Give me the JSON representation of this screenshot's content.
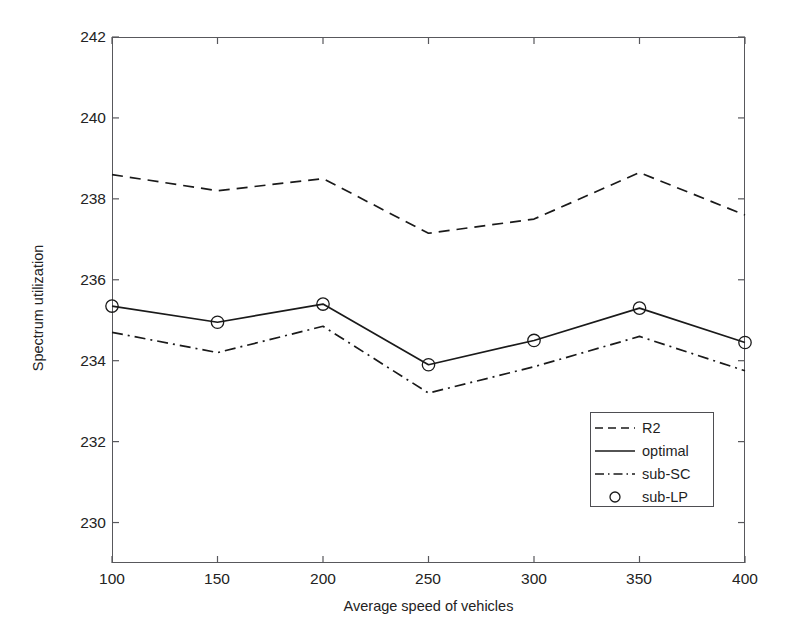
{
  "chart_data": {
    "type": "line",
    "title": "",
    "xlabel": "Average speed of vehicles",
    "ylabel": "Spectrum utilization",
    "x": [
      100,
      150,
      200,
      250,
      300,
      350,
      400
    ],
    "xlim": [
      100,
      400
    ],
    "ylim": [
      229.0,
      242.0
    ],
    "xticks": [
      "100",
      "150",
      "200",
      "250",
      "300",
      "350",
      "400"
    ],
    "yticks": [
      "230",
      "232",
      "234",
      "236",
      "238",
      "240",
      "242"
    ],
    "grid": false,
    "legend_position": "lower right",
    "series": [
      {
        "name": "R2",
        "style": "dashed",
        "marker": "none",
        "color": "#1a1a1a",
        "values": [
          238.6,
          238.2,
          238.5,
          237.15,
          237.5,
          238.65,
          237.6
        ]
      },
      {
        "name": "optimal",
        "style": "solid",
        "marker": "none",
        "color": "#1a1a1a",
        "values": [
          235.35,
          234.95,
          235.4,
          233.9,
          234.5,
          235.3,
          234.45
        ]
      },
      {
        "name": "sub-SC",
        "style": "dashdot",
        "marker": "none",
        "color": "#1a1a1a",
        "values": [
          234.7,
          234.2,
          234.85,
          233.2,
          233.85,
          234.6,
          233.75
        ]
      },
      {
        "name": "sub-LP",
        "style": "none",
        "marker": "circle",
        "color": "#1a1a1a",
        "values": [
          235.35,
          234.95,
          235.4,
          233.9,
          234.5,
          235.3,
          234.45
        ]
      }
    ]
  },
  "legend": {
    "entries": [
      {
        "label": "R2"
      },
      {
        "label": "optimal"
      },
      {
        "label": "sub-SC"
      },
      {
        "label": "sub-LP"
      }
    ]
  }
}
